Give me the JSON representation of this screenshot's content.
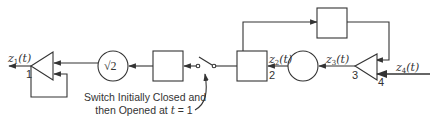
{
  "diagram": {
    "type": "block-diagram",
    "signals": {
      "z1": {
        "base": "z",
        "sub": "1",
        "arg": "(t)"
      },
      "z2": {
        "base": "z",
        "sub": "2",
        "arg": "(t)"
      },
      "z3": {
        "base": "z",
        "sub": "3",
        "arg": "(t)"
      },
      "z4": {
        "base": "z",
        "sub": "4",
        "arg": "(t)"
      }
    },
    "nodes": {
      "amp1_label": "1",
      "box2_label": "2",
      "amp3_label": "3",
      "amp3_input_label": "4",
      "gain_circle": "√2"
    },
    "switch_caption": {
      "line1": "Switch Initially Closed and",
      "line2_prefix": "then Opened at ",
      "line2_var": "t",
      "line2_suffix": " = 1"
    },
    "colors": {
      "stroke": "#333333",
      "background": "#ffffff"
    }
  }
}
